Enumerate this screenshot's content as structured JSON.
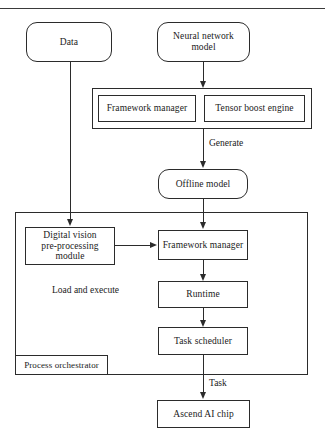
{
  "diagram": {
    "colors": {
      "stroke": "#2b2b2b",
      "background": "#ffffff",
      "text": "#1a1a1a"
    },
    "nodes": {
      "data": {
        "label": "Data",
        "shape": "rounded-rect"
      },
      "neural_network_model": {
        "label": "Neural network model",
        "shape": "rounded-rect"
      },
      "framework_manager_top": {
        "label": "Framework manager",
        "shape": "rect"
      },
      "tensor_boost_engine": {
        "label": "Tensor boost engine",
        "shape": "rect"
      },
      "offline_model": {
        "label": "Offline model",
        "shape": "rounded-rect"
      },
      "digital_vision_preprocessing_module": {
        "label": "Digital vision pre-processing module",
        "line1": "Digital  vision",
        "line2": "pre-processing module",
        "shape": "rect"
      },
      "framework_manager_bottom": {
        "label": "Framework manager",
        "shape": "rect"
      },
      "runtime": {
        "label": "Runtime",
        "shape": "rect"
      },
      "task_scheduler": {
        "label": "Task scheduler",
        "shape": "rect"
      },
      "ascend_ai_chip": {
        "label": "Ascend AI chip",
        "shape": "rect"
      },
      "process_orchestrator": {
        "label": "Process orchestrator",
        "shape": "rect-label"
      }
    },
    "labels": {
      "load_and_execute": "Load and execute"
    },
    "edges": [
      {
        "id": "nn-to-toolgroup",
        "from": "neural_network_model",
        "to": "framework_manager_top",
        "label": ""
      },
      {
        "id": "toolgroup-to-offline",
        "from": "tensor_boost_engine",
        "to": "offline_model",
        "label": "Generate"
      },
      {
        "id": "offline-to-framework",
        "from": "offline_model",
        "to": "framework_manager_bottom",
        "label": ""
      },
      {
        "id": "data-to-dvpp",
        "from": "data",
        "to": "digital_vision_preprocessing_module",
        "label": ""
      },
      {
        "id": "dvpp-to-framework",
        "from": "digital_vision_preprocessing_module",
        "to": "framework_manager_bottom",
        "label": ""
      },
      {
        "id": "framework-to-runtime",
        "from": "framework_manager_bottom",
        "to": "runtime",
        "label": ""
      },
      {
        "id": "runtime-to-scheduler",
        "from": "runtime",
        "to": "task_scheduler",
        "label": ""
      },
      {
        "id": "scheduler-to-chip",
        "from": "task_scheduler",
        "to": "ascend_ai_chip",
        "label": "Task"
      }
    ]
  }
}
